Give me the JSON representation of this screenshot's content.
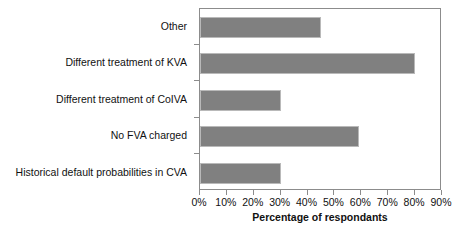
{
  "chart_data": {
    "type": "bar",
    "orientation": "horizontal",
    "title": "",
    "xlabel": "Percentage of respondants",
    "ylabel": "",
    "categories": [
      "Other",
      "Different treatment of KVA",
      "Different treatment of CoIVA",
      "No FVA charged",
      "Historical default probabilities in CVA"
    ],
    "values": [
      45,
      80,
      30,
      59,
      30
    ],
    "value_unit": "%",
    "xlim": [
      0,
      90
    ],
    "xticks": [
      0,
      10,
      20,
      30,
      40,
      50,
      60,
      70,
      80,
      90
    ],
    "xtick_labels": [
      "0%",
      "10%",
      "20%",
      "30%",
      "40%",
      "50%",
      "60%",
      "70%",
      "80%",
      "90%"
    ],
    "grid": false,
    "legend": false,
    "series": [
      {
        "name": "Percentage of respondants",
        "values": [
          45,
          80,
          30,
          59,
          30
        ]
      }
    ],
    "colors": {
      "bar_fill": "#808080",
      "bar_border": "#b9b9b9",
      "axis": "#8c8c8c",
      "text": "#111111",
      "background": "#ffffff"
    }
  }
}
